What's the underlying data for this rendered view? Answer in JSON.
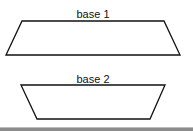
{
  "diagram": {
    "shapes": [
      {
        "name": "trapezoid-1",
        "label": "base 1",
        "label_pos": [
          93,
          18
        ],
        "points": [
          [
            22,
            21
          ],
          [
            164,
            21
          ],
          [
            180,
            55
          ],
          [
            6,
            55
          ]
        ]
      },
      {
        "name": "trapezoid-2",
        "label": "base 2",
        "label_pos": [
          93,
          83
        ],
        "points": [
          [
            21,
            85
          ],
          [
            165,
            85
          ],
          [
            150,
            119
          ],
          [
            37,
            119
          ]
        ]
      }
    ],
    "colors": {
      "stroke": "#111111",
      "background": "#ffffff",
      "bottom_bar": "#8c8c8c"
    }
  }
}
